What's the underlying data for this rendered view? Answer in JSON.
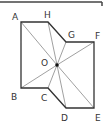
{
  "diagram": {
    "type": "geometry-figure",
    "top_rule": {
      "x1": 0,
      "y1": 2,
      "x2": 102,
      "y2": 2,
      "tick_y2": 6
    },
    "polygon": {
      "vertices": [
        {
          "name": "A",
          "x": 21,
          "y": 22
        },
        {
          "name": "H",
          "x": 48,
          "y": 22
        },
        {
          "name": "G",
          "x": 66,
          "y": 42
        },
        {
          "name": "F",
          "x": 94,
          "y": 42
        },
        {
          "name": "E",
          "x": 94,
          "y": 108
        },
        {
          "name": "D",
          "x": 66,
          "y": 108
        },
        {
          "name": "C",
          "x": 48,
          "y": 88
        },
        {
          "name": "B",
          "x": 21,
          "y": 88
        }
      ],
      "stroke": "#333333"
    },
    "center": {
      "name": "O",
      "x": 57,
      "y": 65
    },
    "spoke_color": "#888888",
    "labels": {
      "A": {
        "text": "A",
        "x": 12,
        "y": 20
      },
      "H": {
        "text": "H",
        "x": 44,
        "y": 18
      },
      "G": {
        "text": "G",
        "x": 68,
        "y": 38
      },
      "F": {
        "text": "F",
        "x": 95,
        "y": 39
      },
      "O": {
        "text": "O",
        "x": 41,
        "y": 66
      },
      "B": {
        "text": "B",
        "x": 11,
        "y": 100
      },
      "C": {
        "text": "C",
        "x": 41,
        "y": 101
      },
      "D": {
        "text": "D",
        "x": 61,
        "y": 121
      },
      "E": {
        "text": "E",
        "x": 95,
        "y": 121
      }
    }
  }
}
